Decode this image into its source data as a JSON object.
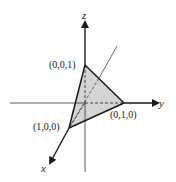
{
  "diagram": {
    "type": "3d-coordinate-plane-triangle",
    "axes": {
      "x_label": "x",
      "y_label": "y",
      "z_label": "z"
    },
    "vertices": [
      {
        "name": "vertex-x",
        "label": "(1,0,0)"
      },
      {
        "name": "vertex-y",
        "label": "(0,1,0)"
      },
      {
        "name": "vertex-z",
        "label": "(0,0,1)"
      }
    ],
    "colors": {
      "fill": "#d4d4d4",
      "stroke": "#1a1a1a",
      "background": "#ffffff"
    }
  }
}
